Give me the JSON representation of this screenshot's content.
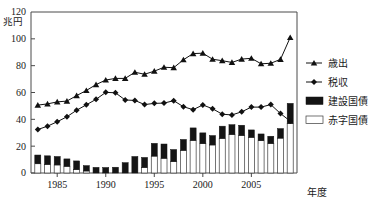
{
  "chart_data": {
    "type": "bar",
    "title": "",
    "subtitle": "",
    "xlabel": "年度",
    "ylabel": "兆円",
    "ylim": [
      0,
      120
    ],
    "xlim": [
      1982.3,
      2009.7
    ],
    "yticks": [
      0,
      20,
      40,
      60,
      80,
      100,
      120
    ],
    "ytick_labels": [
      "0",
      "20",
      "40",
      "60",
      "80",
      "100",
      "120"
    ],
    "xticks": [
      1985,
      1990,
      1995,
      2000,
      2005
    ],
    "xtick_labels": [
      "1985",
      "1990",
      "1995",
      "2000",
      "2005"
    ],
    "grid": false,
    "legend_position": "right",
    "categories": [
      1983,
      1984,
      1985,
      1986,
      1987,
      1988,
      1989,
      1990,
      1991,
      1992,
      1993,
      1994,
      1995,
      1996,
      1997,
      1998,
      1999,
      2000,
      2001,
      2002,
      2003,
      2004,
      2005,
      2006,
      2007,
      2008,
      2009
    ],
    "series": [
      {
        "name": "歳出",
        "type": "line",
        "marker": "triangle",
        "color": "#111111",
        "values": [
          50.6,
          51.5,
          53.0,
          53.6,
          57.7,
          61.5,
          65.9,
          69.3,
          70.5,
          70.5,
          75.1,
          73.6,
          75.9,
          78.8,
          78.5,
          84.4,
          89.0,
          89.3,
          84.8,
          83.7,
          82.4,
          84.9,
          85.5,
          81.4,
          81.8,
          84.7,
          101.0
        ]
      },
      {
        "name": "税収",
        "type": "line",
        "marker": "diamond",
        "color": "#111111",
        "values": [
          32.4,
          34.9,
          38.2,
          41.9,
          46.8,
          50.8,
          54.9,
          60.1,
          59.8,
          54.4,
          54.1,
          51.0,
          51.9,
          52.1,
          53.9,
          49.4,
          47.2,
          50.7,
          47.9,
          43.8,
          43.3,
          45.6,
          49.1,
          49.1,
          51.0,
          44.3,
          38.7
        ]
      },
      {
        "name": "赤字国債",
        "type": "bar",
        "color": "#ffffff",
        "values": [
          6.9,
          6.4,
          6.0,
          5.0,
          2.5,
          1.5,
          0.0,
          0.0,
          0.0,
          0.0,
          0.0,
          4.1,
          12.6,
          11.0,
          8.5,
          16.9,
          24.3,
          21.9,
          20.9,
          25.8,
          28.7,
          28.0,
          26.6,
          24.1,
          22.0,
          26.0,
          36.9
        ]
      },
      {
        "name": "建設国債",
        "type": "bar",
        "color": "#141414",
        "values": [
          6.5,
          6.4,
          6.3,
          5.5,
          6.5,
          4.0,
          4.2,
          4.1,
          4.3,
          7.7,
          12.3,
          7.5,
          9.5,
          10.6,
          9.0,
          8.1,
          9.3,
          8.0,
          7.0,
          9.1,
          7.3,
          7.6,
          5.5,
          5.0,
          5.4,
          7.1,
          15.0
        ]
      }
    ]
  },
  "legend": {
    "items": [
      {
        "label": "歳出",
        "marker": "triangle-line",
        "color": "#111111"
      },
      {
        "label": "税収",
        "marker": "diamond-line",
        "color": "#111111"
      },
      {
        "label": "建設国債",
        "marker": "filled-rect",
        "color": "#141414"
      },
      {
        "label": "赤字国債",
        "marker": "hollow-rect",
        "color": "#ffffff"
      }
    ]
  },
  "axes": {
    "y_unit_label": "兆円",
    "y_top_label": "120",
    "x_axis_label": "年度"
  }
}
